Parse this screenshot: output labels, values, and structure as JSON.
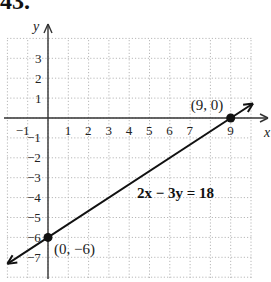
{
  "problem": {
    "number": "43."
  },
  "chart_data": {
    "type": "line",
    "title": "",
    "xlabel": "x",
    "ylabel": "y",
    "xlim": [
      -2,
      10
    ],
    "ylim": [
      -8,
      4
    ],
    "grid": true,
    "x_ticks": [
      "-1",
      "1",
      "2",
      "3",
      "4",
      "5",
      "6",
      "7",
      "9"
    ],
    "y_ticks": [
      "3",
      "2",
      "1",
      "-1",
      "-2",
      "-3",
      "-4",
      "-5",
      "-6",
      "-7"
    ],
    "equation": "2x − 3y = 18",
    "series": [
      {
        "name": "2x − 3y = 18",
        "x": [
          -2,
          0,
          9,
          10.1
        ],
        "y": [
          -7.33,
          -6,
          0,
          0.73
        ]
      }
    ],
    "points": [
      {
        "x": 9,
        "y": 0,
        "label": "(9, 0)"
      },
      {
        "x": 0,
        "y": -6,
        "label": "(0, −6)"
      }
    ],
    "colors": {
      "line": "#111111",
      "grid": "#b8b8b8",
      "axis": "#333333"
    }
  }
}
